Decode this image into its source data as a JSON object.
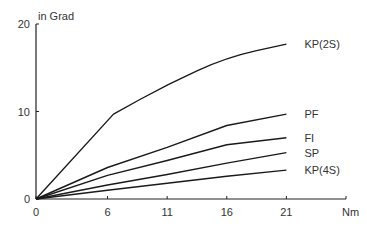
{
  "chart_data": {
    "type": "line",
    "title": "",
    "xlabel": "Nm",
    "ylabel": "in Grad",
    "xlim": [
      0,
      26
    ],
    "ylim": [
      0,
      20
    ],
    "x_ticks": [
      0,
      6,
      11,
      16,
      21
    ],
    "x_tick_labels": [
      "0",
      "6",
      "11",
      "16",
      "21"
    ],
    "y_ticks": [
      0,
      10,
      20
    ],
    "y_tick_labels": [
      "0",
      "10",
      "20"
    ],
    "grid": false,
    "legend_position": "inline-right-of-line-ends",
    "series": [
      {
        "name": "KP(2S)",
        "x": [
          0,
          6.5,
          11,
          16,
          21
        ],
        "values": [
          0,
          9.7,
          13.1,
          16.2,
          17.7
        ]
      },
      {
        "name": "PF",
        "x": [
          0,
          6,
          11,
          16,
          21
        ],
        "values": [
          0,
          3.6,
          5.9,
          8.4,
          9.7
        ]
      },
      {
        "name": "FI",
        "x": [
          0,
          6,
          11,
          16,
          21
        ],
        "values": [
          0,
          2.7,
          4.4,
          6.2,
          7.0
        ]
      },
      {
        "name": "SP",
        "x": [
          0,
          6,
          11,
          16,
          21
        ],
        "values": [
          0,
          1.6,
          2.8,
          4.1,
          5.3
        ]
      },
      {
        "name": "KP(4S)",
        "x": [
          0,
          6,
          11,
          16,
          21
        ],
        "values": [
          0,
          1.0,
          1.8,
          2.6,
          3.3
        ]
      }
    ]
  },
  "labels": {
    "y_unit": "in Grad",
    "x_unit": "Nm"
  }
}
